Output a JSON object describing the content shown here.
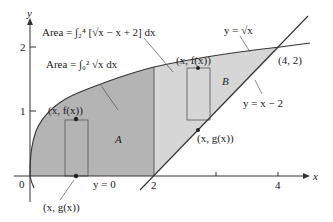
{
  "axes": {
    "x_label": "x",
    "y_label": "y",
    "origin_label": "0",
    "x_ticks": [
      {
        "value": 2,
        "label": "2"
      },
      {
        "value": 3,
        "label": ""
      },
      {
        "value": 4,
        "label": "4"
      }
    ],
    "y_ticks": [
      {
        "value": 1,
        "label": "1"
      },
      {
        "value": 2,
        "label": "2"
      }
    ]
  },
  "curves": {
    "sqrt_label": "y = √x",
    "line_label": "y = x − 2",
    "zero_label": "y = 0"
  },
  "regions": {
    "A": "A",
    "B": "B",
    "colors": {
      "A": "#b4b4b4",
      "B": "#d6d6d6"
    }
  },
  "annotations": {
    "area_B_formula": "Area = ∫₂⁴ [√x − x + 2] dx",
    "area_A_formula": "Area = ∫₀² √x dx",
    "intersection": "(4, 2)",
    "fx_left": "(x, f(x))",
    "gx_left": "(x, g(x))",
    "fx_right": "(x, f(x))",
    "gx_right": "(x, g(x))"
  }
}
